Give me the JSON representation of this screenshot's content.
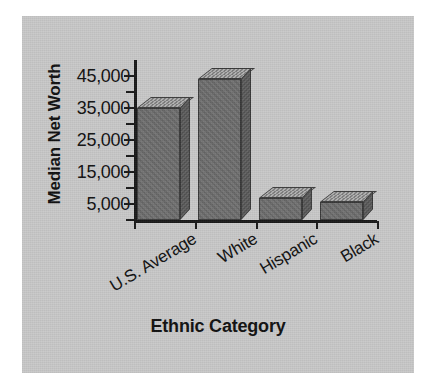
{
  "figure": {
    "background_color": "#c9c9c9",
    "page_color": "#ffffff",
    "axis_color": "#1a1a1a",
    "bar_face_color": "#6e6e6e",
    "bar_top_color": "#8f8f8f",
    "bar_side_color": "#5a5a5a"
  },
  "chart_data": {
    "type": "bar",
    "title": "",
    "xlabel": "Ethnic Category",
    "ylabel": "Median Net Worth",
    "categories": [
      "U.S. Average",
      "White",
      "Hispanic",
      "Black"
    ],
    "values": [
      35000,
      44000,
      7000,
      5500
    ],
    "ylim": [
      0,
      50000
    ],
    "ytick_values": [
      5000,
      15000,
      25000,
      35000,
      45000
    ],
    "ytick_labels": [
      "5,000",
      "15,000",
      "25,000",
      "35,000",
      "45,000"
    ],
    "minor_tick_interval": 5000,
    "grid": false,
    "legend": false,
    "style_3d": true
  },
  "axes": {
    "y_title": "Median Net Worth",
    "x_title": "Ethnic Category",
    "y_labels": [
      {
        "text": "45,000",
        "value": 45000
      },
      {
        "text": "35,000",
        "value": 35000
      },
      {
        "text": "25,000",
        "value": 25000
      },
      {
        "text": "15,000",
        "value": 15000
      },
      {
        "text": "5,000",
        "value": 5000
      }
    ]
  },
  "bars": [
    {
      "label": "U.S. Average",
      "value": 35000
    },
    {
      "label": "White",
      "value": 44000
    },
    {
      "label": "Hispanic",
      "value": 7000
    },
    {
      "label": "Black",
      "value": 5500
    }
  ]
}
